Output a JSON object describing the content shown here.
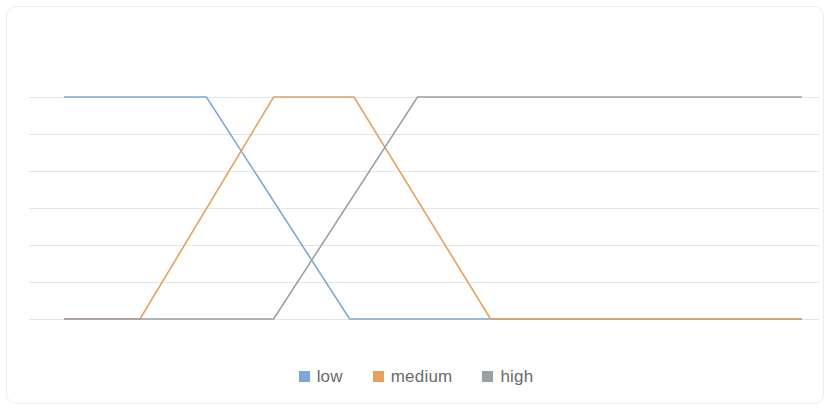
{
  "chart_data": {
    "type": "line",
    "title": "",
    "subtitle": "",
    "xlabel": "",
    "ylabel": "",
    "xlim": [
      0,
      100
    ],
    "ylim": [
      0,
      1
    ],
    "grid": true,
    "grid_axis": "y",
    "grid_count": 6,
    "x_tick_labels": [],
    "y_tick_labels": [],
    "legend_position": "bottom",
    "series": [
      {
        "name": "low",
        "color": "#7CA8D8",
        "points": [
          {
            "x": 0,
            "y": 1
          },
          {
            "x": 19.3,
            "y": 1
          },
          {
            "x": 38.7,
            "y": 0
          },
          {
            "x": 100,
            "y": 0
          }
        ]
      },
      {
        "name": "medium",
        "color": "#E8A05C",
        "points": [
          {
            "x": 0,
            "y": 0
          },
          {
            "x": 10.3,
            "y": 0
          },
          {
            "x": 28.4,
            "y": 1
          },
          {
            "x": 39.3,
            "y": 1
          },
          {
            "x": 57.8,
            "y": 0
          },
          {
            "x": 100,
            "y": 0
          }
        ]
      },
      {
        "name": "high",
        "color": "#9AA0A6",
        "points": [
          {
            "x": 0,
            "y": 0
          },
          {
            "x": 28.4,
            "y": 0
          },
          {
            "x": 47.9,
            "y": 1
          },
          {
            "x": 100,
            "y": 1
          }
        ]
      }
    ]
  },
  "legend": {
    "items": [
      {
        "label": "low",
        "color": "#7CA8D8",
        "icon": "legend-swatch-icon"
      },
      {
        "label": "medium",
        "color": "#E8A05C",
        "icon": "legend-swatch-icon"
      },
      {
        "label": "high",
        "color": "#9AA0A6",
        "icon": "legend-swatch-icon"
      }
    ]
  },
  "style": {
    "grid_color": "#dfe6ef",
    "frame_border_color": "#ededed",
    "background": "#ffffff",
    "legend_text_color": "#6b6b6b"
  }
}
